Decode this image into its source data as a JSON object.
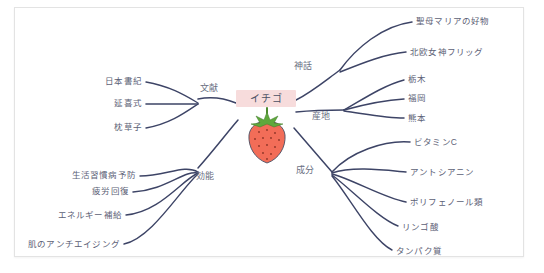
{
  "document": {
    "type": "mind-map",
    "center": {
      "label": "イチゴ",
      "label_bg_color": "#f7dcdc",
      "illustration": "strawberry-illustration"
    },
    "colors": {
      "branch_stroke": "#3d4466",
      "text": "#5c6176",
      "berry_body": "#f26d58",
      "berry_calyx": "#5fa83c",
      "frame_border": "#e3e3e3",
      "background": "#ffffff"
    }
  },
  "branches": [
    {
      "id": "bunken",
      "label": "文献",
      "side": "left",
      "leaves": [
        {
          "label": "日本書紀"
        },
        {
          "label": "延喜式"
        },
        {
          "label": "枕草子"
        }
      ]
    },
    {
      "id": "kounou",
      "label": "効能",
      "side": "left",
      "leaves": [
        {
          "label": "生活習慣病予防"
        },
        {
          "label": "疲労回復"
        },
        {
          "label": "エネルギー補給"
        },
        {
          "label": "肌のアンチエイジング"
        }
      ]
    },
    {
      "id": "shinwa",
      "label": "神話",
      "side": "right",
      "leaves": [
        {
          "label": "聖母マリアの好物"
        },
        {
          "label": "北欧女神フリッグ"
        }
      ]
    },
    {
      "id": "sanchi",
      "label": "産地",
      "side": "right",
      "leaves": [
        {
          "label": "栃木"
        },
        {
          "label": "福岡"
        },
        {
          "label": "熊本"
        }
      ]
    },
    {
      "id": "seibun",
      "label": "成分",
      "side": "right",
      "leaves": [
        {
          "label": "ビタミンC"
        },
        {
          "label": "アントシアニン"
        },
        {
          "label": "ポリフェノール類"
        },
        {
          "label": "リンゴ酸"
        },
        {
          "label": "タンパク質"
        }
      ]
    }
  ]
}
